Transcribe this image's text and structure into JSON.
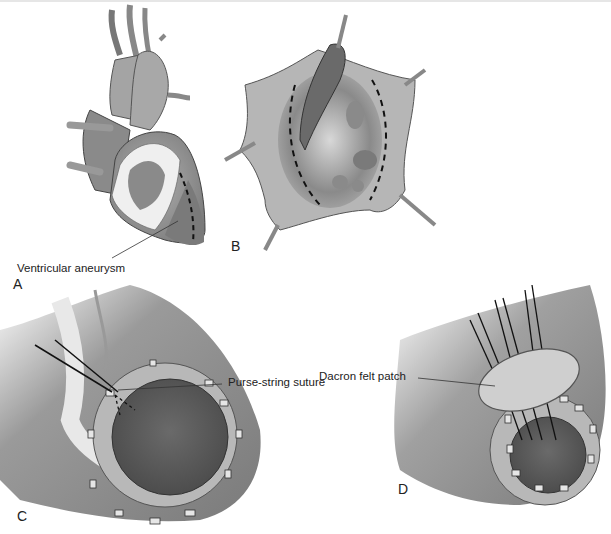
{
  "figure": {
    "panels": [
      {
        "id": "A",
        "letter": "A",
        "callout": "Ventricular aneurysm"
      },
      {
        "id": "B",
        "letter": "B"
      },
      {
        "id": "C",
        "letter": "C",
        "callout": "Purse-string suture"
      },
      {
        "id": "D",
        "letter": "D",
        "callout": "Dacron felt patch"
      }
    ]
  },
  "colors": {
    "tissue_dark": "#6e6e6e",
    "tissue_mid": "#9a9a9a",
    "tissue_light": "#c8c8c8",
    "fat_white": "#efefef",
    "cavity": "#585858",
    "outline": "#3a3a3a",
    "suture": "#111111"
  }
}
